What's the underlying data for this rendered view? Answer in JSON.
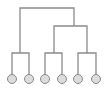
{
  "diagram": {
    "type": "dendrogram",
    "colors": {
      "line": "#8a8a8a",
      "leaf_fill": "#dcdcdc",
      "leaf_stroke": "#8a8a8a",
      "background": "#ffffff"
    },
    "leaf_radius": 4.5,
    "leaves": [
      {
        "id": "leaf-1",
        "x": 12,
        "y": 79
      },
      {
        "id": "leaf-2",
        "x": 29,
        "y": 79
      },
      {
        "id": "leaf-3",
        "x": 45,
        "y": 79
      },
      {
        "id": "leaf-4",
        "x": 62,
        "y": 79
      },
      {
        "id": "leaf-5",
        "x": 78,
        "y": 79
      },
      {
        "id": "leaf-6",
        "x": 96,
        "y": 79
      }
    ],
    "links": [
      {
        "id": "root-bar",
        "d": "M20 53 V8 H74 V26"
      },
      {
        "id": "subtree-right-bar",
        "d": "M54 53 V26 H87 V53"
      },
      {
        "id": "cluster-a",
        "d": "M12 74.5 V53 H29 V74.5"
      },
      {
        "id": "cluster-b",
        "d": "M45 74.5 V53 H62 V74.5"
      },
      {
        "id": "cluster-c",
        "d": "M78 74.5 V53 H96 V74.5"
      }
    ]
  }
}
